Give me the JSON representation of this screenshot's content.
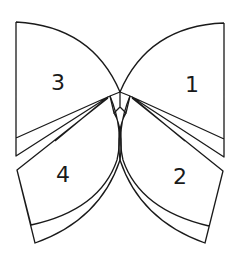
{
  "diagram": {
    "stroke_color": "#1a1a1a",
    "background": "#ffffff",
    "pieces": [
      {
        "id": "piece-1",
        "label": "1",
        "position": "upper-right"
      },
      {
        "id": "piece-2",
        "label": "2",
        "position": "lower-right"
      },
      {
        "id": "piece-3",
        "label": "3",
        "position": "upper-left"
      },
      {
        "id": "piece-4",
        "label": "4",
        "position": "lower-left"
      }
    ]
  }
}
